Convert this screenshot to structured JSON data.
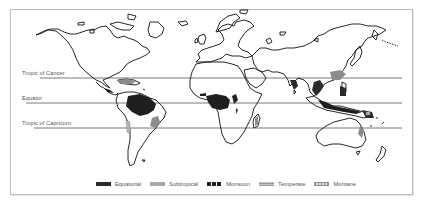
{
  "map": {
    "type": "world thematic map",
    "subject": "tropical/regional climate zones"
  },
  "reference_lines": [
    {
      "label": "Tropic of Cancer",
      "y": 78
    },
    {
      "label": "Equator",
      "y": 103
    },
    {
      "label": "Tropic of Capricorn",
      "y": 128
    }
  ],
  "legend": {
    "items": [
      {
        "label": "Equatorial",
        "pattern": "solid-dark",
        "color": "#2a2a2a"
      },
      {
        "label": "Subtropical",
        "pattern": "solid-light-gray",
        "color": "#a8a8a8"
      },
      {
        "label": "Monsoon",
        "pattern": "dark-vertical-bars",
        "color": "#1e1e1e"
      },
      {
        "label": "Temperate",
        "pattern": "gray-horizontal-hatch",
        "color": "#9a9a9a"
      },
      {
        "label": "Montane",
        "pattern": "light-vertical-hatch",
        "color": "#8f8f8f"
      }
    ]
  },
  "colors": {
    "frame_border": "#bdbdbd",
    "coastline": "#111111",
    "reference_line": "#555555",
    "label_text": "#555555"
  }
}
